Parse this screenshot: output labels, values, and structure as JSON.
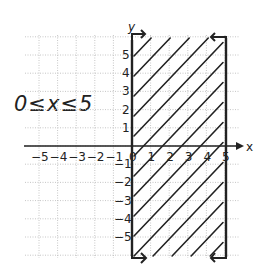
{
  "chart_data": {
    "type": "inequality-graph",
    "inequality": "0 ≤ x ≤ 5",
    "xlabel": "x",
    "ylabel": "y",
    "x_ticks": [
      -5,
      -4,
      -3,
      -2,
      -1,
      0,
      1,
      2,
      3,
      4,
      5
    ],
    "y_ticks": [
      -5,
      -4,
      -3,
      -2,
      -1,
      1,
      2,
      3,
      4,
      5
    ],
    "xlim": [
      -5.8,
      5.8
    ],
    "ylim": [
      -6,
      6
    ],
    "grid": true,
    "boundaries": [
      {
        "line": "x = 0",
        "style": "solid",
        "arrows": "both ends"
      },
      {
        "line": "x = 5",
        "style": "solid",
        "arrows": "both ends"
      }
    ],
    "shaded_region": {
      "x_min": 0,
      "x_max": 5,
      "pattern": "diagonal hatch"
    }
  },
  "labels": {
    "inequality": "0≤x≤5",
    "x_axis": "x",
    "y_axis": "y",
    "x_tick_labels": [
      "−5",
      "−4",
      "−3",
      "−2",
      "−1",
      "0",
      "1",
      "2",
      "3",
      "4",
      "5"
    ],
    "y_tick_labels_pos": [
      "1",
      "2",
      "3",
      "4",
      "5"
    ],
    "y_tick_labels_neg": [
      "−1",
      "−2",
      "−3",
      "−4",
      "−5"
    ]
  },
  "colors": {
    "ink": "#222222",
    "grid": "#b8b8b8",
    "background": "#ffffff"
  }
}
